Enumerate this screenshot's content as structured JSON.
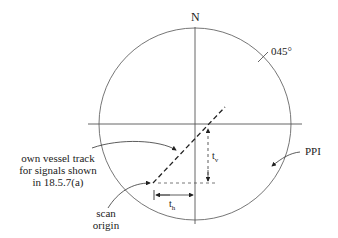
{
  "diagram": {
    "labels": {
      "north": "N",
      "bearing": "045°",
      "ppi": "PPI",
      "track_line1": "own vessel track",
      "track_line2": "for signals shown",
      "track_line3": "in 18.5.7(a)",
      "scan_line1": "scan",
      "scan_line2": "origin",
      "t_vertical": "t",
      "t_vertical_sub": "v",
      "t_horizontal": "t",
      "t_horizontal_sub": "h"
    },
    "colors": {
      "line": "#555555",
      "dashed": "#222222",
      "background": "#ffffff"
    }
  }
}
